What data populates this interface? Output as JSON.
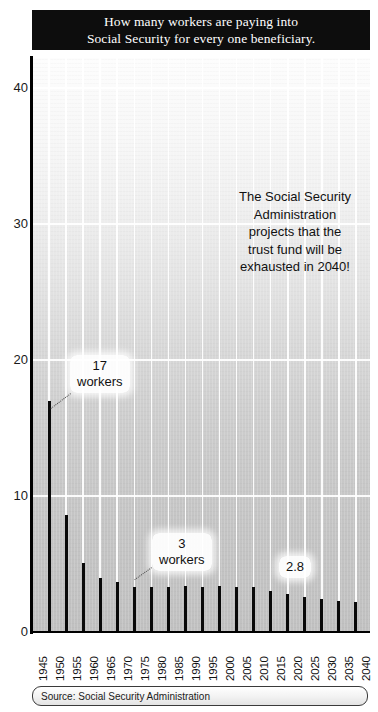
{
  "title": {
    "line1": "How many workers are paying into",
    "line2": "Social Security for every one beneficiary."
  },
  "annotation": {
    "line1": "The Social Security",
    "line2": "Administration",
    "line3": "projects that the",
    "line4": "trust fund will be",
    "line5": "exhausted in 2040!"
  },
  "callouts": [
    {
      "name": "callout-17-workers",
      "value": "17",
      "unit": "workers",
      "x": 70,
      "y": 355
    },
    {
      "name": "callout-3-workers",
      "value": "3",
      "unit": "workers",
      "x": 152,
      "y": 533
    },
    {
      "name": "callout-2-8",
      "value": "2.8",
      "unit": "",
      "x": 279,
      "y": 556
    }
  ],
  "source": {
    "label": "Source: Social Security Administration"
  },
  "colors": {
    "bar": "#0a0a0a",
    "banner_bg": "#0d0d0d",
    "banner_text": "#ffffff",
    "grid": "#ffffff",
    "axis": "#000000",
    "plot_bg_top": "#fdfdfd",
    "plot_bg_bottom": "#c0c0c0"
  },
  "chart_data": {
    "type": "bar",
    "title": "How many workers are paying into Social Security for every one beneficiary.",
    "xlabel": "",
    "ylabel": "",
    "ylim": [
      0,
      42
    ],
    "yticks": [
      0,
      10,
      20,
      30,
      40
    ],
    "grid": true,
    "legend": "none",
    "categories": [
      "1945",
      "1950",
      "1955",
      "1960",
      "1965",
      "1970",
      "1975",
      "1980",
      "1985",
      "1990",
      "1995",
      "2000",
      "2005",
      "2010",
      "2015",
      "2020",
      "2025",
      "2030",
      "2035",
      "2040"
    ],
    "values": [
      null,
      17,
      8.6,
      5.1,
      4.0,
      3.7,
      3.3,
      3.3,
      3.3,
      3.4,
      3.3,
      3.4,
      3.3,
      3.3,
      3.0,
      2.8,
      2.6,
      2.4,
      2.3,
      2.2
    ],
    "annotations": [
      {
        "text": "17 workers",
        "category": "1950",
        "value": 17
      },
      {
        "text": "3 workers",
        "category": "1980",
        "value": 3.3
      },
      {
        "text": "2.8",
        "category": "2020",
        "value": 2.8
      }
    ],
    "source": "Source: Social Security Administration"
  }
}
